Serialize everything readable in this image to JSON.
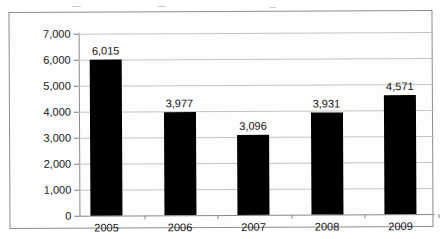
{
  "chart_data": {
    "type": "bar",
    "title": "",
    "subtitle": "",
    "xlabel": "",
    "ylabel": "",
    "categories": [
      "2005",
      "2006",
      "2007",
      "2008",
      "2009"
    ],
    "values": [
      6015,
      3977,
      3096,
      3931,
      4571
    ],
    "data_labels": [
      "6,015",
      "3,977",
      "3,096",
      "3,931",
      "4,571"
    ],
    "ylim": [
      0,
      7000
    ],
    "ytick_values": [
      7000,
      6000,
      5000,
      4000,
      3000,
      2000,
      1000,
      0
    ],
    "ytick_labels": [
      "7,000",
      "6,000",
      "5,000",
      "4,000",
      "3,000",
      "2,000",
      "1,000",
      "0"
    ],
    "grid": true,
    "legend": "none",
    "bar_color": "#000000",
    "gridline_color": "#c4c4c4",
    "axis_color": "#8a8a8a",
    "plot_background": "#fdfdfd"
  }
}
